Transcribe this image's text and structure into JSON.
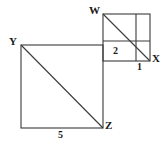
{
  "figure": {
    "background_color": "#ffffff",
    "stroke_color": "#3a3a3a",
    "label_color": "#1a1a1a",
    "vertices": {
      "W": "W",
      "X": "X",
      "Y": "Y",
      "Z": "Z"
    },
    "side_lengths": {
      "small_square": "1",
      "inner_segment": "2",
      "large_square": "5"
    },
    "shapes": {
      "large_square": {
        "name": "large-square",
        "x": 21,
        "y": 45,
        "size": 82,
        "corner_top_left_label": "Y",
        "corner_bottom_right_label": "Z",
        "bottom_label": "5",
        "diagonal": "top-left to bottom-right"
      },
      "small_square": {
        "name": "small-square",
        "x": 103,
        "y": 14,
        "size": 47,
        "corner_top_left_label": "W",
        "corner_bottom_right_label": "X",
        "bottom_label": "1",
        "inner_cell_label": "2",
        "vertical_divider_x": 136,
        "horizontal_divider_y": 41,
        "diagonal": "top-left to bottom-right"
      }
    }
  }
}
